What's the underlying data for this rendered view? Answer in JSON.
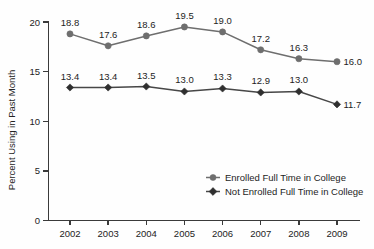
{
  "chart_data": {
    "type": "line",
    "title": "",
    "xlabel": "",
    "ylabel": "Percent Using in Past Month",
    "categories": [
      "2002",
      "2003",
      "2004",
      "2005",
      "2006",
      "2007",
      "2008",
      "2009"
    ],
    "x": [
      2002,
      2003,
      2004,
      2005,
      2006,
      2007,
      2008,
      2009
    ],
    "ylim": [
      0,
      20
    ],
    "yticks": [
      0,
      5,
      10,
      15,
      20
    ],
    "ytick_labels": [
      "0",
      "5",
      "10",
      "15",
      "20"
    ],
    "grid": false,
    "legend_position": "center-right-lower",
    "series": [
      {
        "name": "Enrolled Full Time in College",
        "marker": "circle",
        "color": "#6e6e6e",
        "values": [
          18.8,
          17.6,
          18.6,
          19.5,
          19.0,
          17.2,
          16.3,
          16.0
        ],
        "labels": [
          "18.8",
          "17.6",
          "18.6",
          "19.5",
          "19.0",
          "17.2",
          "16.3",
          "16.0"
        ]
      },
      {
        "name": "Not Enrolled Full Time in College",
        "marker": "diamond",
        "color": "#2f2f2f",
        "values": [
          13.4,
          13.4,
          13.5,
          13.0,
          13.3,
          12.9,
          13.0,
          11.7
        ],
        "labels": [
          "13.4",
          "13.4",
          "13.5",
          "13.0",
          "13.3",
          "12.9",
          "13.0",
          "11.7"
        ]
      }
    ]
  },
  "legend": {
    "items": [
      {
        "label": "Enrolled Full Time in College"
      },
      {
        "label": "Not Enrolled Full Time in College"
      }
    ]
  },
  "colors": {
    "series_a": "#6e6e6e",
    "series_b": "#2f2f2f",
    "axis": "#3a3a3a",
    "text": "#1d1d1d",
    "background": "#fefefe"
  }
}
